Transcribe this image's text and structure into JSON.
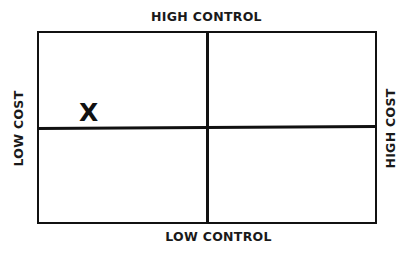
{
  "diagram": {
    "type": "2x2 matrix",
    "axes": {
      "top": "HIGH CONTROL",
      "bottom": "LOW CONTROL",
      "left": "LOW COST",
      "right": "HIGH COST"
    },
    "quadrants": [
      {
        "position": "top-left",
        "content": "X"
      },
      {
        "position": "top-right",
        "content": ""
      },
      {
        "position": "bottom-left",
        "content": ""
      },
      {
        "position": "bottom-right",
        "content": ""
      }
    ],
    "marker": "X",
    "line_color": "#111111",
    "background": "#ffffff"
  }
}
